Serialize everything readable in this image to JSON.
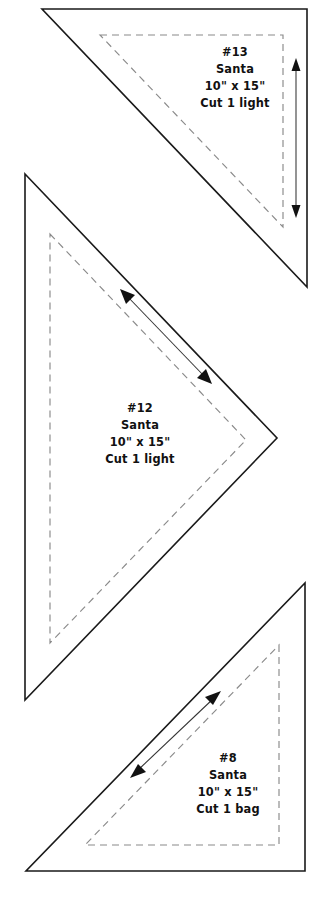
{
  "document": {
    "kind": "quilt-pattern-template-sheet",
    "page_background": "#ffffff",
    "cut_line_color": "#1a1a1a",
    "seam_line_color": "#8a8a8a",
    "grain_arrow_color": "#111111",
    "text_color": "#111111"
  },
  "pieces": [
    {
      "id": "piece-13",
      "number": "#13",
      "name": "Santa",
      "size": "10\" x 15\"",
      "instruction": "Cut 1 light",
      "shape": "right-triangle",
      "grain_arrow": "vertical-double",
      "label_lines": [
        "#13",
        "Santa",
        "10\" x 15\"",
        "Cut 1 light"
      ]
    },
    {
      "id": "piece-12",
      "number": "#12",
      "name": "Santa",
      "size": "10\" x 15\"",
      "instruction": "Cut 1 light",
      "shape": "right-triangle",
      "grain_arrow": "diagonal-double",
      "label_lines": [
        "#12",
        "Santa",
        "10\" x 15\"",
        "Cut 1 light"
      ]
    },
    {
      "id": "piece-8",
      "number": "#8",
      "name": "Santa",
      "size": "10\" x 15\"",
      "instruction": "Cut 1 bag",
      "shape": "right-triangle",
      "grain_arrow": "diagonal-double",
      "label_lines": [
        "#8",
        "Santa",
        "10\" x 15\"",
        "Cut 1 bag"
      ]
    }
  ]
}
